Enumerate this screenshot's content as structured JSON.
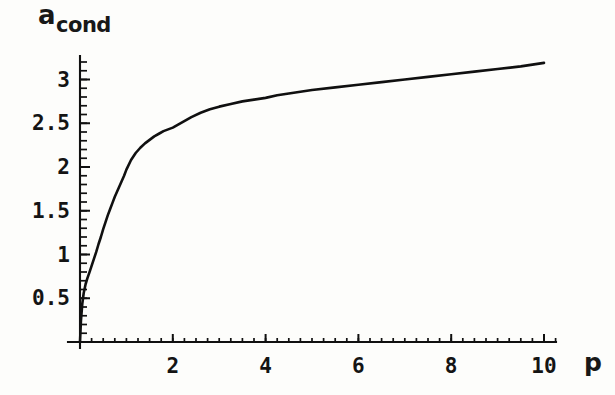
{
  "chart_data": {
    "type": "line",
    "title": "",
    "ylabel": "a_cond",
    "ylabel_base": "a",
    "ylabel_sub": "cond",
    "xlabel": "p",
    "xlim": [
      0,
      10.6
    ],
    "ylim": [
      0,
      3.35
    ],
    "grid": false,
    "legend": "none",
    "x_ticks": [
      2,
      4,
      6,
      8,
      10
    ],
    "x_tick_labels": [
      "2",
      "4",
      "6",
      "8",
      "10"
    ],
    "x_minor_tick_step": 0.25,
    "y_ticks": [
      0.5,
      1,
      1.5,
      2,
      2.5,
      3
    ],
    "y_tick_labels": [
      "0.5",
      "1",
      "1.5",
      "2",
      "2.5",
      "3"
    ],
    "y_minor_tick_step": 0.1,
    "series": [
      {
        "name": "a_cond(p)",
        "color": "#101010",
        "x": [
          0.0,
          0.02,
          0.05,
          0.08,
          0.12,
          0.16,
          0.2,
          0.25,
          0.3,
          0.35,
          0.4,
          0.45,
          0.5,
          0.55,
          0.6,
          0.65,
          0.7,
          0.75,
          0.8,
          0.85,
          0.9,
          0.95,
          1.0,
          1.1,
          1.2,
          1.3,
          1.4,
          1.5,
          1.6,
          1.7,
          1.8,
          1.9,
          2.0,
          2.2,
          2.4,
          2.6,
          2.8,
          3.0,
          3.25,
          3.5,
          3.75,
          4.0,
          4.25,
          4.5,
          4.75,
          5.0,
          5.5,
          6.0,
          6.5,
          7.0,
          7.5,
          8.0,
          8.5,
          9.0,
          9.5,
          10.0
        ],
        "y": [
          0.0,
          0.24,
          0.44,
          0.56,
          0.66,
          0.73,
          0.79,
          0.87,
          0.95,
          1.03,
          1.12,
          1.2,
          1.29,
          1.37,
          1.45,
          1.52,
          1.59,
          1.66,
          1.72,
          1.78,
          1.84,
          1.9,
          1.97,
          2.08,
          2.16,
          2.22,
          2.27,
          2.31,
          2.35,
          2.38,
          2.41,
          2.43,
          2.45,
          2.51,
          2.57,
          2.62,
          2.66,
          2.69,
          2.72,
          2.75,
          2.77,
          2.79,
          2.82,
          2.84,
          2.86,
          2.88,
          2.91,
          2.94,
          2.97,
          3.0,
          3.03,
          3.06,
          3.09,
          3.12,
          3.15,
          3.19
        ]
      }
    ]
  },
  "plot_geometry": {
    "origin_px": {
      "x": 80,
      "y": 342
    },
    "x_scale_px_per_unit": 46.4,
    "y_scale_px_per_unit": 87.5,
    "x_axis_end_px": 556,
    "y_axis_top_px": 56
  }
}
